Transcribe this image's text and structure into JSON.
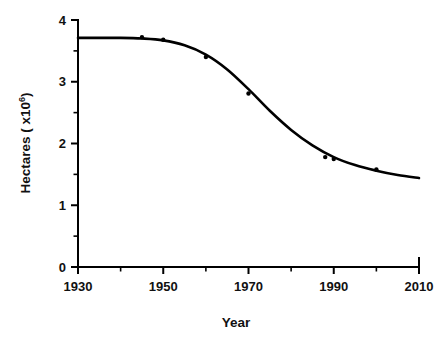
{
  "chart_data": {
    "type": "scatter",
    "title": "",
    "subtitle": "",
    "xlabel": "Year",
    "ylabel_text": "Hectares ( x10",
    "ylabel_sup": "6",
    "ylabel_tail": ")",
    "ylabel_full": "Hectares ( x10⁶)",
    "xlim": [
      1930,
      2010
    ],
    "ylim": [
      0,
      4
    ],
    "grid": false,
    "legend": null,
    "x_ticks_major": [
      1930,
      1950,
      1970,
      1990,
      2010
    ],
    "x_tick_labels": [
      "1930",
      "1950",
      "1970",
      "1990",
      "2010"
    ],
    "x_ticks_minor": [
      1940,
      1960,
      1980,
      2000
    ],
    "y_ticks_major": [
      0,
      1,
      2,
      3,
      4
    ],
    "y_tick_labels": [
      "0",
      "1",
      "2",
      "3",
      "4"
    ],
    "y_ticks_minor": [
      0.5,
      1.5,
      2.5,
      3.5
    ],
    "series": [
      {
        "name": "Observed hectares",
        "type": "scatter",
        "marker": "dot",
        "color": "#000000",
        "points": [
          {
            "x": 1945,
            "y": 3.72
          },
          {
            "x": 1950,
            "y": 3.68
          },
          {
            "x": 1960,
            "y": 3.4
          },
          {
            "x": 1970,
            "y": 2.81
          },
          {
            "x": 1988,
            "y": 1.78
          },
          {
            "x": 1990,
            "y": 1.75
          },
          {
            "x": 2000,
            "y": 1.58
          }
        ]
      },
      {
        "name": "Fitted logistic decline",
        "type": "line",
        "color": "#000000",
        "points": [
          {
            "x": 1930,
            "y": 3.71
          },
          {
            "x": 1935,
            "y": 3.71
          },
          {
            "x": 1940,
            "y": 3.71
          },
          {
            "x": 1945,
            "y": 3.7
          },
          {
            "x": 1950,
            "y": 3.67
          },
          {
            "x": 1955,
            "y": 3.59
          },
          {
            "x": 1960,
            "y": 3.44
          },
          {
            "x": 1965,
            "y": 3.2
          },
          {
            "x": 1970,
            "y": 2.88
          },
          {
            "x": 1975,
            "y": 2.53
          },
          {
            "x": 1980,
            "y": 2.22
          },
          {
            "x": 1985,
            "y": 1.97
          },
          {
            "x": 1990,
            "y": 1.78
          },
          {
            "x": 1995,
            "y": 1.65
          },
          {
            "x": 2000,
            "y": 1.56
          },
          {
            "x": 2005,
            "y": 1.49
          },
          {
            "x": 2010,
            "y": 1.44
          }
        ]
      }
    ],
    "axis_color": "#000000",
    "background_color": "#ffffff"
  },
  "figure": {
    "caption": ""
  }
}
